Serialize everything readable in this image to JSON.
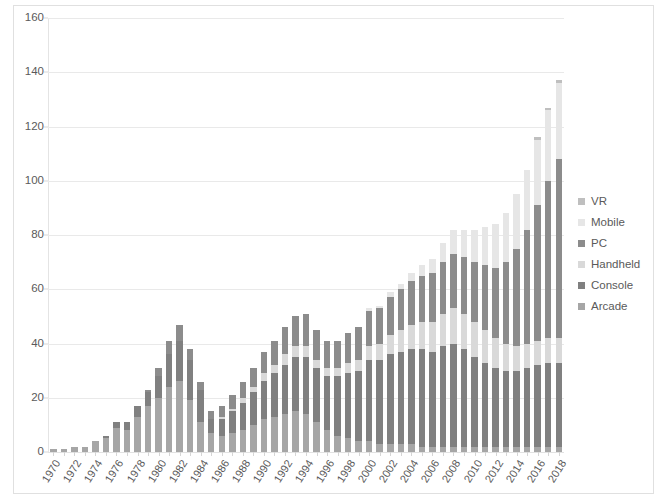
{
  "chart_data": {
    "type": "bar",
    "title": "",
    "subtitle": "",
    "xlabel": "",
    "ylabel": "",
    "stacked": true,
    "grid": true,
    "legend_position": "right",
    "ylim": [
      0,
      160
    ],
    "y_ticks": [
      0,
      20,
      40,
      60,
      80,
      100,
      120,
      140,
      160
    ],
    "x": [
      1970,
      1971,
      1972,
      1973,
      1974,
      1975,
      1976,
      1977,
      1978,
      1979,
      1980,
      1981,
      1982,
      1983,
      1984,
      1985,
      1986,
      1987,
      1988,
      1989,
      1990,
      1991,
      1992,
      1993,
      1994,
      1995,
      1996,
      1997,
      1998,
      1999,
      2000,
      2001,
      2002,
      2003,
      2004,
      2005,
      2006,
      2007,
      2008,
      2009,
      2010,
      2011,
      2012,
      2013,
      2014,
      2015,
      2016,
      2017,
      2018
    ],
    "x_tick_labels": [
      "1970",
      "1972",
      "1974",
      "1976",
      "1978",
      "1980",
      "1982",
      "1984",
      "1986",
      "1988",
      "1990",
      "1992",
      "1994",
      "1996",
      "1998",
      "2000",
      "2002",
      "2004",
      "2006",
      "2008",
      "2010",
      "2012",
      "2014",
      "2016",
      "2018"
    ],
    "series": [
      {
        "name": "Arcade",
        "color": "#a6a6a6",
        "values": [
          1,
          1,
          2,
          2,
          4,
          5,
          9,
          8,
          13,
          17,
          20,
          24,
          26,
          19,
          11,
          7,
          6,
          7,
          8,
          10,
          12,
          13,
          14,
          15,
          14,
          11,
          8,
          6,
          5,
          4,
          4,
          3,
          3,
          3,
          3,
          2,
          2,
          2,
          2,
          2,
          2,
          2,
          2,
          2,
          2,
          2,
          2,
          2,
          2
        ]
      },
      {
        "name": "Console",
        "color": "#808080",
        "values": [
          0,
          0,
          0,
          0,
          0,
          1,
          2,
          3,
          4,
          5,
          8,
          12,
          15,
          15,
          12,
          5,
          6,
          8,
          10,
          12,
          14,
          16,
          18,
          20,
          21,
          20,
          20,
          22,
          24,
          26,
          30,
          31,
          33,
          34,
          35,
          36,
          35,
          37,
          38,
          36,
          33,
          31,
          29,
          28,
          28,
          29,
          30,
          31,
          31
        ]
      },
      {
        "name": "Handheld",
        "color": "#d9d9d9",
        "values": [
          0,
          0,
          0,
          0,
          0,
          0,
          0,
          0,
          0,
          0,
          0,
          0,
          0,
          0,
          0,
          0,
          1,
          1,
          2,
          2,
          3,
          3,
          4,
          4,
          4,
          3,
          3,
          3,
          4,
          4,
          5,
          6,
          7,
          8,
          9,
          10,
          11,
          12,
          13,
          13,
          13,
          12,
          11,
          10,
          9,
          9,
          9,
          9,
          9
        ]
      },
      {
        "name": "PC",
        "color": "#8c8c8c",
        "values": [
          0,
          0,
          0,
          0,
          0,
          0,
          0,
          0,
          0,
          1,
          3,
          5,
          6,
          4,
          3,
          3,
          4,
          5,
          6,
          7,
          8,
          9,
          10,
          11,
          12,
          11,
          10,
          10,
          11,
          12,
          13,
          13,
          14,
          15,
          16,
          17,
          18,
          19,
          20,
          21,
          22,
          24,
          26,
          30,
          36,
          42,
          50,
          58,
          66
        ]
      },
      {
        "name": "Mobile",
        "color": "#e6e6e6",
        "values": [
          0,
          0,
          0,
          0,
          0,
          0,
          0,
          0,
          0,
          0,
          0,
          0,
          0,
          0,
          0,
          0,
          0,
          0,
          0,
          0,
          0,
          0,
          0,
          0,
          0,
          0,
          0,
          0,
          0,
          0,
          1,
          1,
          2,
          2,
          3,
          4,
          5,
          7,
          9,
          10,
          12,
          14,
          16,
          18,
          20,
          22,
          24,
          26,
          28
        ]
      },
      {
        "name": "VR",
        "color": "#bfbfbf",
        "values": [
          0,
          0,
          0,
          0,
          0,
          0,
          0,
          0,
          0,
          0,
          0,
          0,
          0,
          0,
          0,
          0,
          0,
          0,
          0,
          0,
          0,
          0,
          0,
          0,
          0,
          0,
          0,
          0,
          0,
          0,
          0,
          0,
          0,
          0,
          0,
          0,
          0,
          0,
          0,
          0,
          0,
          0,
          0,
          0,
          0,
          0,
          1,
          1,
          1
        ]
      }
    ],
    "totals": [
      1,
      1,
      2,
      2,
      4,
      6,
      11,
      11,
      17,
      23,
      31,
      41,
      47,
      38,
      26,
      15,
      17,
      21,
      26,
      31,
      37,
      41,
      46,
      50,
      51,
      45,
      41,
      41,
      44,
      46,
      53,
      54,
      59,
      62,
      66,
      69,
      71,
      77,
      82,
      82,
      82,
      83,
      84,
      88,
      95,
      104,
      116,
      127,
      137
    ]
  },
  "legend": {
    "items": [
      {
        "label": "VR"
      },
      {
        "label": "Mobile"
      },
      {
        "label": "PC"
      },
      {
        "label": "Handheld"
      },
      {
        "label": "Console"
      },
      {
        "label": "Arcade"
      }
    ]
  },
  "colors": {
    "gridline": "#e9e9e9",
    "frame": "#e0e0e0",
    "axis_text": "#5a5a5a",
    "background": "#ffffff"
  }
}
